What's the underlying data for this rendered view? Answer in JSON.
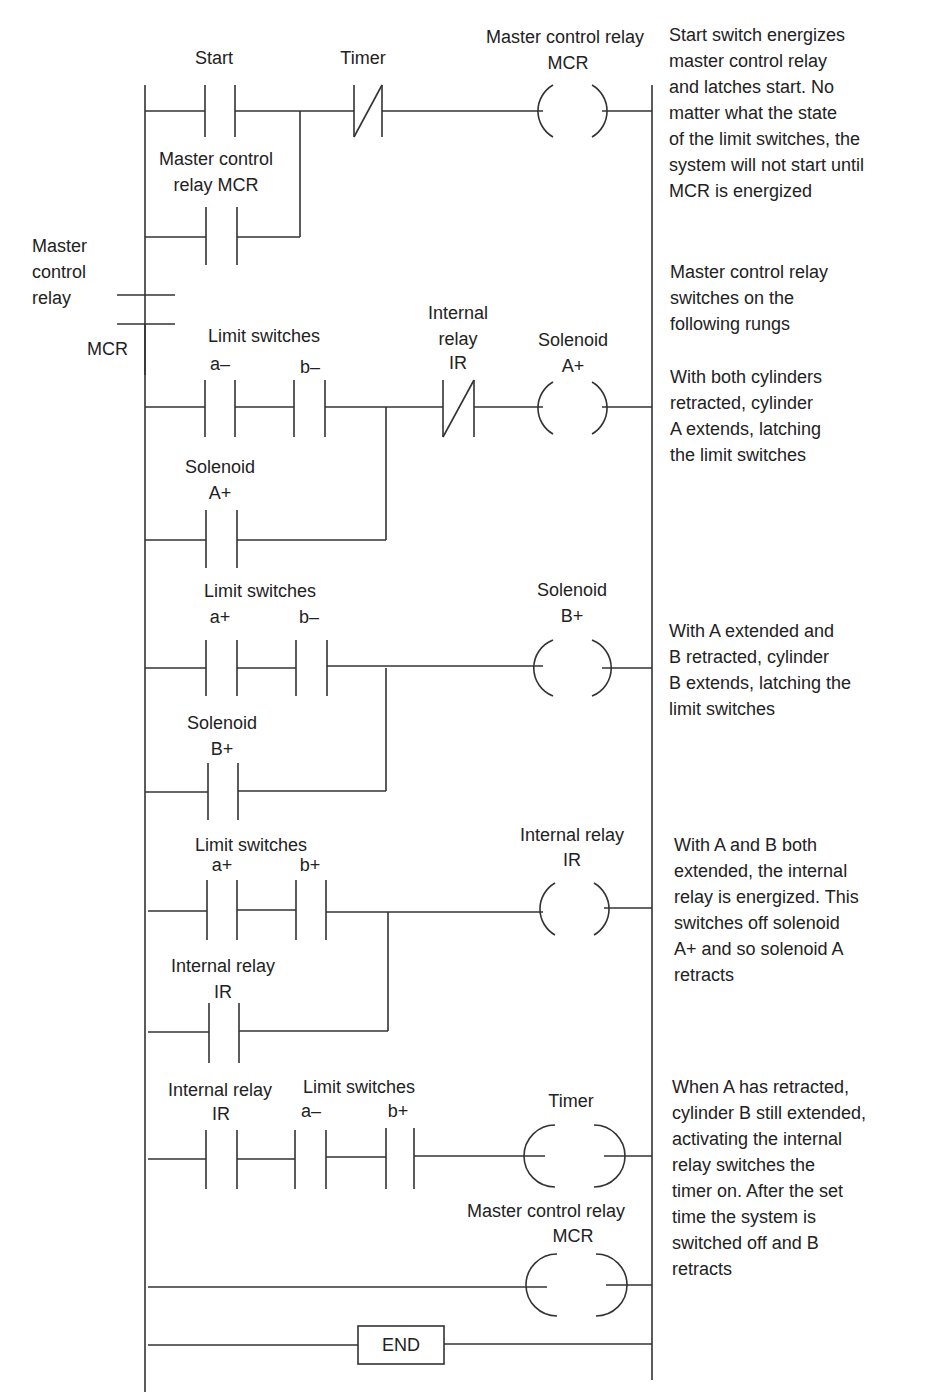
{
  "diagram": {
    "type": "ladder-logic",
    "title_hint": "Two-cylinder sequence A+ B+ A- B- with master control relay"
  },
  "labels": {
    "r1_start": "Start",
    "r1_timer": "Timer",
    "r1_coil_1": "Master control relay",
    "r1_coil_2": "MCR",
    "r1_branch_1": "Master control",
    "r1_branch_2": "relay MCR",
    "mcr_side_1": "Master",
    "mcr_side_2": "control",
    "mcr_side_3": "relay",
    "mcr_side_4": "MCR",
    "r2_limit": "Limit switches",
    "r2_a": "a–",
    "r2_b": "b–",
    "r2_ir_1": "Internal",
    "r2_ir_2": "relay",
    "r2_ir_3": "IR",
    "r2_coil_1": "Solenoid",
    "r2_coil_2": "A+",
    "r2_branch_1": "Solenoid",
    "r2_branch_2": "A+",
    "r3_limit": "Limit switches",
    "r3_a": "a+",
    "r3_b": "b–",
    "r3_coil_1": "Solenoid",
    "r3_coil_2": "B+",
    "r3_branch_1": "Solenoid",
    "r3_branch_2": "B+",
    "r4_limit": "Limit switches",
    "r4_a": "a+",
    "r4_b": "b+",
    "r4_coil_1": "Internal relay",
    "r4_coil_2": "IR",
    "r4_branch_1": "Internal relay",
    "r4_branch_2": "IR",
    "r5_ir_1": "Internal relay",
    "r5_ir_2": "IR",
    "r5_limit": "Limit switches",
    "r5_a": "a–",
    "r5_b": "b+",
    "r5_coil": "Timer",
    "r6_coil_1": "Master control relay",
    "r6_coil_2": "MCR",
    "end": "END"
  },
  "notes": {
    "n1": "Start switch energizes\nmaster control relay\nand latches start. No\nmatter what the state\nof the limit switches, the\nsystem will not start until\nMCR is energized",
    "n2": "Master control relay\nswitches on the\nfollowing rungs",
    "n3": "With both cylinders\nretracted, cylinder\nA extends, latching\nthe limit switches",
    "n4": "With A extended and\nB retracted, cylinder\nB extends, latching the\nlimit switches",
    "n5": "With A and B both\nextended, the internal\nrelay is energized. This\nswitches off solenoid\nA+ and so solenoid A\nretracts",
    "n6": "When A has retracted,\ncylinder B still extended,\nactivating the internal\nrelay switches the\ntimer on. After the set\ntime the system is\nswitched off and B\nretracts"
  }
}
